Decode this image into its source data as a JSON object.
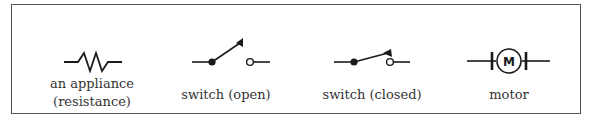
{
  "diagram": {
    "colors": {
      "stroke": "#1a1a1a",
      "frame": "#555555",
      "text": "#333333"
    },
    "symbols": [
      {
        "id": "resistor",
        "icon": "resistor-zigzag-icon",
        "label_line1": "an appliance",
        "label_line2": "(resistance)"
      },
      {
        "id": "switch-open",
        "icon": "switch-open-icon",
        "label_line1": "switch (open)"
      },
      {
        "id": "switch-closed",
        "icon": "switch-closed-icon",
        "label_line1": "switch (closed)"
      },
      {
        "id": "motor",
        "icon": "motor-icon",
        "glyph": "M",
        "label_line1": "motor"
      }
    ]
  }
}
